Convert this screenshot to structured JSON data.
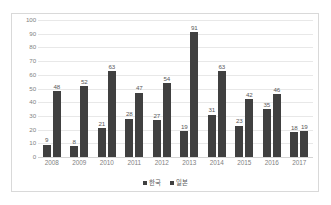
{
  "chart_data": {
    "type": "bar",
    "title": "",
    "xlabel": "",
    "ylabel": "",
    "ylim": [
      0,
      100
    ],
    "yticks": [
      100,
      90,
      80,
      70,
      60,
      50,
      40,
      30,
      20,
      10,
      0
    ],
    "grid": true,
    "legend_position": "bottom",
    "categories": [
      "2008",
      "2009",
      "2010",
      "2011",
      "2012",
      "2013",
      "2014",
      "2015",
      "2016",
      "2017"
    ],
    "series": [
      {
        "name": "한국",
        "color": "#404040",
        "values": [
          9,
          8,
          21,
          28,
          27,
          19,
          31,
          23,
          35,
          18
        ]
      },
      {
        "name": "일본",
        "color": "#404040",
        "values": [
          48,
          52,
          63,
          47,
          54,
          91,
          63,
          42,
          46,
          19
        ]
      }
    ]
  },
  "legend": {
    "items": [
      {
        "label": "한국"
      },
      {
        "label": "일본"
      }
    ]
  }
}
